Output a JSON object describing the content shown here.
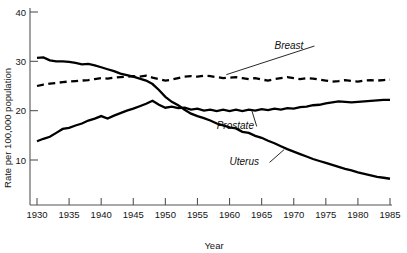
{
  "chart_data": {
    "type": "line",
    "title": "",
    "xlabel": "Year",
    "ylabel": "Rate per 100,000 population",
    "xlim": [
      1930,
      1985
    ],
    "ylim": [
      0,
      40
    ],
    "xticks": [
      1930,
      1935,
      1940,
      1945,
      1950,
      1955,
      1960,
      1965,
      1970,
      1975,
      1980,
      1985
    ],
    "xtick_labels": [
      "1930",
      "1935",
      "1940",
      "1945",
      "1950",
      "1955",
      "1960",
      "1965",
      "1970",
      "1975",
      "1980",
      "1985"
    ],
    "yticks": [
      10,
      20,
      30,
      40
    ],
    "ytick_labels": [
      "10",
      "20",
      "30",
      "40"
    ],
    "grid": false,
    "legend_position": "inline-annotations",
    "series": [
      {
        "name": "Breast",
        "style": "dashed",
        "color": "#000000",
        "label_annotation": "Breast",
        "x": [
          1930,
          1931,
          1932,
          1933,
          1934,
          1935,
          1936,
          1937,
          1938,
          1939,
          1940,
          1941,
          1942,
          1943,
          1944,
          1945,
          1946,
          1947,
          1948,
          1949,
          1950,
          1951,
          1952,
          1953,
          1954,
          1955,
          1956,
          1957,
          1958,
          1959,
          1960,
          1961,
          1962,
          1963,
          1964,
          1965,
          1966,
          1967,
          1968,
          1969,
          1970,
          1971,
          1972,
          1973,
          1974,
          1975,
          1976,
          1977,
          1978,
          1979,
          1980,
          1981,
          1982,
          1983,
          1984,
          1985
        ],
        "values": [
          25.0,
          25.3,
          25.5,
          25.6,
          25.8,
          25.9,
          26.0,
          26.1,
          26.2,
          26.4,
          26.6,
          26.5,
          26.7,
          26.8,
          26.9,
          27.0,
          26.9,
          27.1,
          26.7,
          26.4,
          26.1,
          26.3,
          26.6,
          26.9,
          27.0,
          26.9,
          27.1,
          27.0,
          26.8,
          26.6,
          26.7,
          26.8,
          26.6,
          26.4,
          26.6,
          26.3,
          26.1,
          26.4,
          26.6,
          26.8,
          26.6,
          26.4,
          26.6,
          26.5,
          26.3,
          26.1,
          25.9,
          26.0,
          26.2,
          26.0,
          25.9,
          26.1,
          26.2,
          26.1,
          26.2,
          26.3
        ]
      },
      {
        "name": "Uterus",
        "style": "solid",
        "color": "#000000",
        "label_annotation": "Uterus",
        "x": [
          1930,
          1931,
          1932,
          1933,
          1934,
          1935,
          1936,
          1937,
          1938,
          1939,
          1940,
          1941,
          1942,
          1943,
          1944,
          1945,
          1946,
          1947,
          1948,
          1949,
          1950,
          1951,
          1952,
          1953,
          1954,
          1955,
          1956,
          1957,
          1958,
          1959,
          1960,
          1961,
          1962,
          1963,
          1964,
          1965,
          1966,
          1967,
          1968,
          1969,
          1970,
          1971,
          1972,
          1973,
          1974,
          1975,
          1976,
          1977,
          1978,
          1979,
          1980,
          1981,
          1982,
          1983,
          1984,
          1985
        ],
        "values": [
          30.7,
          30.8,
          30.2,
          30.0,
          30.0,
          29.9,
          29.7,
          29.4,
          29.5,
          29.2,
          28.8,
          28.4,
          28.0,
          27.5,
          27.2,
          26.9,
          26.5,
          26.1,
          25.4,
          24.2,
          22.8,
          21.8,
          21.1,
          20.2,
          19.4,
          18.9,
          18.5,
          18.0,
          17.4,
          17.0,
          16.6,
          16.4,
          15.7,
          15.5,
          14.9,
          14.5,
          13.9,
          13.4,
          12.8,
          12.2,
          11.7,
          11.2,
          10.7,
          10.2,
          9.8,
          9.4,
          9.0,
          8.6,
          8.2,
          7.9,
          7.5,
          7.2,
          6.9,
          6.6,
          6.4,
          6.2
        ]
      },
      {
        "name": "Prostate",
        "style": "solid",
        "color": "#000000",
        "label_annotation": "Prostate",
        "x": [
          1930,
          1931,
          1932,
          1933,
          1934,
          1935,
          1936,
          1937,
          1938,
          1939,
          1940,
          1941,
          1942,
          1943,
          1944,
          1945,
          1946,
          1947,
          1948,
          1949,
          1950,
          1951,
          1952,
          1953,
          1954,
          1955,
          1956,
          1957,
          1958,
          1959,
          1960,
          1961,
          1962,
          1963,
          1964,
          1965,
          1966,
          1967,
          1968,
          1969,
          1970,
          1971,
          1972,
          1973,
          1974,
          1975,
          1976,
          1977,
          1978,
          1979,
          1980,
          1981,
          1982,
          1983,
          1984,
          1985
        ],
        "values": [
          13.8,
          14.3,
          14.7,
          15.5,
          16.3,
          16.5,
          17.0,
          17.4,
          18.0,
          18.4,
          18.9,
          18.4,
          19.0,
          19.5,
          20.0,
          20.4,
          20.9,
          21.4,
          22.0,
          21.2,
          20.6,
          20.8,
          20.5,
          20.6,
          20.2,
          20.4,
          20.0,
          20.2,
          19.9,
          20.2,
          19.9,
          20.2,
          19.9,
          20.2,
          20.0,
          20.3,
          20.1,
          20.4,
          20.2,
          20.5,
          20.4,
          20.7,
          20.8,
          21.1,
          21.2,
          21.5,
          21.7,
          21.9,
          21.8,
          21.7,
          21.8,
          21.9,
          22.0,
          22.1,
          22.2,
          22.2
        ]
      }
    ],
    "annotations": [
      {
        "text": "Breast",
        "x_label": 1967,
        "y_label": 32.5
      },
      {
        "text": "Prostate",
        "x_label": 1958,
        "y_label": 16.2
      },
      {
        "text": "Uterus",
        "x_label": 1960,
        "y_label": 8.9
      }
    ]
  }
}
